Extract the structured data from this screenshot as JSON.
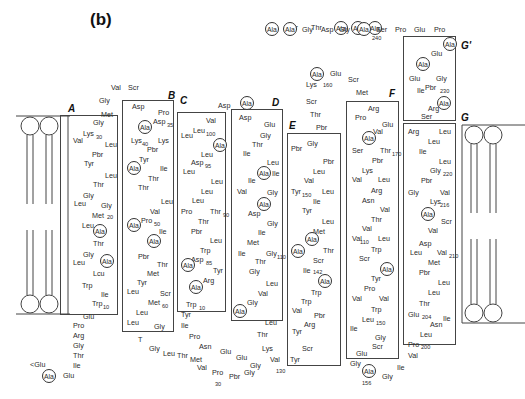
{
  "panel_label": "(b)",
  "colors": {
    "line": "#444444",
    "text": "#2a2a2a"
  },
  "helices": [
    {
      "label": "A",
      "box": [
        60,
        115,
        58,
        200
      ],
      "label_pos": [
        68,
        103
      ]
    },
    {
      "label": "B",
      "box": [
        122,
        100,
        52,
        232
      ],
      "label_pos": [
        168,
        90
      ]
    },
    {
      "label": "C",
      "box": [
        177,
        112,
        49,
        200
      ],
      "label_pos": [
        180,
        95
      ]
    },
    {
      "label": "D",
      "box": [
        231,
        109,
        52,
        212
      ],
      "label_pos": [
        272,
        97
      ]
    },
    {
      "label": "E",
      "box": [
        287,
        133,
        54,
        233
      ],
      "label_pos": [
        289,
        120
      ]
    },
    {
      "label": "F",
      "box": [
        346,
        101,
        53,
        258
      ],
      "label_pos": [
        389,
        88
      ]
    },
    {
      "label": "G'",
      "box": [
        403,
        36,
        53,
        85
      ],
      "label_pos": [
        461,
        40
      ]
    },
    {
      "label": "G",
      "box": [
        403,
        123,
        53,
        222
      ],
      "label_pos": [
        461,
        112
      ]
    }
  ],
  "membrane": [
    {
      "name": "left-bilayer",
      "x": 18,
      "y": 116,
      "w": 48,
      "h": 200
    },
    {
      "name": "right-bilayer",
      "x": 462,
      "y": 125,
      "w": 50,
      "h": 200
    }
  ],
  "residues": [
    {
      "t": "Scr",
      "x": 287,
      "y": 24
    },
    {
      "t": "Thr",
      "x": 311,
      "y": 24
    },
    {
      "t": "Ala",
      "x": 334,
      "y": 21,
      "c": true
    },
    {
      "t": "Ala",
      "x": 351,
      "y": 21,
      "c": true
    },
    {
      "t": "Ala",
      "x": 368,
      "y": 21,
      "c": true
    },
    {
      "t": "Ala",
      "x": 265,
      "y": 22,
      "c": true
    },
    {
      "t": "Ala",
      "x": 283,
      "y": 22,
      "c": true
    },
    {
      "t": "Gly",
      "x": 302,
      "y": 26
    },
    {
      "t": "Asp",
      "x": 321,
      "y": 26
    },
    {
      "t": "Gly",
      "x": 339,
      "y": 26
    },
    {
      "t": "Ala",
      "x": 357,
      "y": 22,
      "c": true
    },
    {
      "t": "Ser",
      "x": 376,
      "y": 26
    },
    {
      "t": "240",
      "x": 372,
      "y": 34,
      "s": true
    },
    {
      "t": "Pro",
      "x": 395,
      "y": 26
    },
    {
      "t": "Glu",
      "x": 414,
      "y": 26
    },
    {
      "t": "Pro",
      "x": 434,
      "y": 26
    },
    {
      "t": "Ala",
      "x": 443,
      "y": 37,
      "c": true
    },
    {
      "t": "Glu",
      "x": 431,
      "y": 50
    },
    {
      "t": "Ala",
      "x": 416,
      "y": 57,
      "c": true
    },
    {
      "t": "Glu",
      "x": 409,
      "y": 75
    },
    {
      "t": "Gly",
      "x": 436,
      "y": 75
    },
    {
      "t": "Ile",
      "x": 417,
      "y": 87
    },
    {
      "t": "Pbr",
      "x": 425,
      "y": 84
    },
    {
      "t": "230",
      "x": 440,
      "y": 87,
      "s": true
    },
    {
      "t": "Ala",
      "x": 437,
      "y": 96,
      "c": true
    },
    {
      "t": "Arg",
      "x": 428,
      "y": 105
    },
    {
      "t": "Ser",
      "x": 421,
      "y": 113
    },
    {
      "t": "Ala",
      "x": 310,
      "y": 67,
      "c": true
    },
    {
      "t": "Glu",
      "x": 330,
      "y": 70
    },
    {
      "t": "Scr",
      "x": 348,
      "y": 76
    },
    {
      "t": "Lys",
      "x": 306,
      "y": 81
    },
    {
      "t": "160",
      "x": 323,
      "y": 81,
      "s": true
    },
    {
      "t": "Met",
      "x": 356,
      "y": 89
    },
    {
      "t": "Scr",
      "x": 306,
      "y": 98
    },
    {
      "t": "Thr",
      "x": 310,
      "y": 111
    },
    {
      "t": "Pbr",
      "x": 316,
      "y": 124
    },
    {
      "t": "Val",
      "x": 111,
      "y": 84
    },
    {
      "t": "Scr",
      "x": 128,
      "y": 84
    },
    {
      "t": "Gly",
      "x": 99,
      "y": 97
    },
    {
      "t": "Met",
      "x": 101,
      "y": 111
    },
    {
      "t": "Gly",
      "x": 93,
      "y": 119
    },
    {
      "t": "Lys",
      "x": 83,
      "y": 130
    },
    {
      "t": "30",
      "x": 96,
      "y": 133,
      "s": true
    },
    {
      "t": "Val",
      "x": 73,
      "y": 137
    },
    {
      "t": "Leu",
      "x": 105,
      "y": 141
    },
    {
      "t": "Pbr",
      "x": 92,
      "y": 151
    },
    {
      "t": "Tyr",
      "x": 84,
      "y": 160
    },
    {
      "t": "Leu",
      "x": 105,
      "y": 172
    },
    {
      "t": "Thr",
      "x": 93,
      "y": 181
    },
    {
      "t": "Gly",
      "x": 83,
      "y": 192
    },
    {
      "t": "Leu",
      "x": 74,
      "y": 200
    },
    {
      "t": "Gly",
      "x": 101,
      "y": 202
    },
    {
      "t": "Met",
      "x": 92,
      "y": 212
    },
    {
      "t": "20",
      "x": 107,
      "y": 213,
      "s": true
    },
    {
      "t": "Leu",
      "x": 82,
      "y": 222
    },
    {
      "t": "Ala",
      "x": 93,
      "y": 224,
      "c": true
    },
    {
      "t": "Thr",
      "x": 93,
      "y": 240
    },
    {
      "t": "Gly",
      "x": 83,
      "y": 251
    },
    {
      "t": "Leu",
      "x": 73,
      "y": 259
    },
    {
      "t": "Ala",
      "x": 100,
      "y": 254,
      "c": true
    },
    {
      "t": "Lcu",
      "x": 93,
      "y": 270
    },
    {
      "t": "Trp",
      "x": 82,
      "y": 282
    },
    {
      "t": "Ile",
      "x": 101,
      "y": 291
    },
    {
      "t": "Trp",
      "x": 92,
      "y": 300
    },
    {
      "t": "10",
      "x": 103,
      "y": 303,
      "s": true
    },
    {
      "t": "Glu",
      "x": 83,
      "y": 313
    },
    {
      "t": "Pro",
      "x": 73,
      "y": 322
    },
    {
      "t": "Arg",
      "x": 73,
      "y": 332
    },
    {
      "t": "Gly",
      "x": 73,
      "y": 342
    },
    {
      "t": "Thr",
      "x": 73,
      "y": 352
    },
    {
      "t": "Ile",
      "x": 73,
      "y": 362
    },
    {
      "t": "<Glu",
      "x": 30,
      "y": 361
    },
    {
      "t": "Ala",
      "x": 42,
      "y": 369,
      "c": true
    },
    {
      "t": "Glu",
      "x": 63,
      "y": 372
    },
    {
      "t": "Asp",
      "x": 132,
      "y": 103
    },
    {
      "t": "Pro",
      "x": 158,
      "y": 109
    },
    {
      "t": "Ala",
      "x": 138,
      "y": 120,
      "c": true
    },
    {
      "t": "Asp",
      "x": 153,
      "y": 118
    },
    {
      "t": "35",
      "x": 167,
      "y": 121,
      "s": true
    },
    {
      "t": "Lys",
      "x": 131,
      "y": 137
    },
    {
      "t": "40",
      "x": 142,
      "y": 140,
      "s": true
    },
    {
      "t": "Lys",
      "x": 158,
      "y": 137
    },
    {
      "t": "Pbr",
      "x": 147,
      "y": 146
    },
    {
      "t": "Tyr",
      "x": 139,
      "y": 156
    },
    {
      "t": "Ala",
      "x": 127,
      "y": 161,
      "c": true
    },
    {
      "t": "Ile",
      "x": 160,
      "y": 165
    },
    {
      "t": "Thr",
      "x": 148,
      "y": 175
    },
    {
      "t": "Thr",
      "x": 138,
      "y": 184
    },
    {
      "t": "Leu",
      "x": 161,
      "y": 198
    },
    {
      "t": "Val",
      "x": 150,
      "y": 208
    },
    {
      "t": "Ala",
      "x": 127,
      "y": 218,
      "c": true
    },
    {
      "t": "Pro",
      "x": 141,
      "y": 217
    },
    {
      "t": "50",
      "x": 154,
      "y": 220,
      "s": true
    },
    {
      "t": "Ile",
      "x": 159,
      "y": 228
    },
    {
      "t": "Ala",
      "x": 147,
      "y": 234,
      "c": true
    },
    {
      "t": "Pbr",
      "x": 138,
      "y": 253
    },
    {
      "t": "Thr",
      "x": 157,
      "y": 261
    },
    {
      "t": "Met",
      "x": 147,
      "y": 270
    },
    {
      "t": "Tyr",
      "x": 137,
      "y": 279
    },
    {
      "t": "Leu",
      "x": 127,
      "y": 288
    },
    {
      "t": "Scr",
      "x": 160,
      "y": 290
    },
    {
      "t": "Met",
      "x": 148,
      "y": 299
    },
    {
      "t": "60",
      "x": 162,
      "y": 302,
      "s": true
    },
    {
      "t": "Leu",
      "x": 136,
      "y": 309
    },
    {
      "t": "Leu",
      "x": 127,
      "y": 319
    },
    {
      "t": "Gly",
      "x": 154,
      "y": 323
    },
    {
      "t": "T",
      "x": 138,
      "y": 336
    },
    {
      "t": "Gly",
      "x": 149,
      "y": 345
    },
    {
      "t": "Leu",
      "x": 163,
      "y": 350
    },
    {
      "t": "Thr",
      "x": 177,
      "y": 352
    },
    {
      "t": "Met",
      "x": 190,
      "y": 356
    },
    {
      "t": "Val",
      "x": 197,
      "y": 364
    },
    {
      "t": "Pro",
      "x": 212,
      "y": 369
    },
    {
      "t": "30",
      "x": 215,
      "y": 380,
      "s": true
    },
    {
      "t": "Pbr",
      "x": 229,
      "y": 373
    },
    {
      "t": "Gly",
      "x": 244,
      "y": 369
    },
    {
      "t": "Asp",
      "x": 218,
      "y": 102
    },
    {
      "t": "Ala",
      "x": 240,
      "y": 96,
      "c": true
    },
    {
      "t": "Val",
      "x": 206,
      "y": 117
    },
    {
      "t": "Leu",
      "x": 193,
      "y": 127
    },
    {
      "t": "100",
      "x": 206,
      "y": 130,
      "s": true
    },
    {
      "t": "Leu",
      "x": 181,
      "y": 132
    },
    {
      "t": "Ala",
      "x": 213,
      "y": 138,
      "c": true
    },
    {
      "t": "Leu",
      "x": 201,
      "y": 151
    },
    {
      "t": "Asp",
      "x": 191,
      "y": 159
    },
    {
      "t": "95",
      "x": 205,
      "y": 162,
      "s": true
    },
    {
      "t": "Leu",
      "x": 183,
      "y": 168
    },
    {
      "t": "Leu",
      "x": 211,
      "y": 178
    },
    {
      "t": "Leu",
      "x": 201,
      "y": 188
    },
    {
      "t": "Leu",
      "x": 192,
      "y": 197
    },
    {
      "t": "Pro",
      "x": 181,
      "y": 208
    },
    {
      "t": "Thr",
      "x": 210,
      "y": 208
    },
    {
      "t": "90",
      "x": 223,
      "y": 211,
      "s": true
    },
    {
      "t": "Thr",
      "x": 198,
      "y": 218
    },
    {
      "t": "Pbr",
      "x": 191,
      "y": 228
    },
    {
      "t": "Leu",
      "x": 210,
      "y": 237
    },
    {
      "t": "Trp",
      "x": 200,
      "y": 247
    },
    {
      "t": "Asp",
      "x": 191,
      "y": 256
    },
    {
      "t": "85",
      "x": 206,
      "y": 259,
      "s": true
    },
    {
      "t": "Ala",
      "x": 181,
      "y": 258,
      "c": true
    },
    {
      "t": "Tyr",
      "x": 213,
      "y": 267
    },
    {
      "t": "Arg",
      "x": 203,
      "y": 277
    },
    {
      "t": "Ala",
      "x": 189,
      "y": 280,
      "c": true
    },
    {
      "t": "Trp",
      "x": 186,
      "y": 301
    },
    {
      "t": "10",
      "x": 199,
      "y": 304,
      "s": true
    },
    {
      "t": "Tyr",
      "x": 181,
      "y": 311
    },
    {
      "t": "Ile",
      "x": 181,
      "y": 322
    },
    {
      "t": "Pro",
      "x": 189,
      "y": 333
    },
    {
      "t": "Asn",
      "x": 199,
      "y": 343
    },
    {
      "t": "Glu",
      "x": 220,
      "y": 348
    },
    {
      "t": "Glu",
      "x": 236,
      "y": 354
    },
    {
      "t": "Gly",
      "x": 250,
      "y": 362
    },
    {
      "t": "Asp",
      "x": 239,
      "y": 114
    },
    {
      "t": "Glu",
      "x": 264,
      "y": 121
    },
    {
      "t": "Gly",
      "x": 260,
      "y": 132
    },
    {
      "t": "Thr",
      "x": 252,
      "y": 141
    },
    {
      "t": "Ile",
      "x": 243,
      "y": 150
    },
    {
      "t": "Leu",
      "x": 267,
      "y": 159
    },
    {
      "t": "Ala",
      "x": 257,
      "y": 166,
      "c": true
    },
    {
      "t": "Ile",
      "x": 272,
      "y": 170
    },
    {
      "t": "Ile",
      "x": 248,
      "y": 177
    },
    {
      "t": "Val",
      "x": 237,
      "y": 188
    },
    {
      "t": "Gly",
      "x": 267,
      "y": 189
    },
    {
      "t": "Ala",
      "x": 257,
      "y": 197,
      "c": true
    },
    {
      "t": "Asp",
      "x": 248,
      "y": 210
    },
    {
      "t": "Gly",
      "x": 267,
      "y": 220
    },
    {
      "t": "Ile",
      "x": 258,
      "y": 229
    },
    {
      "t": "Met",
      "x": 247,
      "y": 239
    },
    {
      "t": "Ile",
      "x": 238,
      "y": 250
    },
    {
      "t": "Gly",
      "x": 266,
      "y": 250
    },
    {
      "t": "110",
      "x": 277,
      "y": 253,
      "s": true
    },
    {
      "t": "Thr",
      "x": 255,
      "y": 258
    },
    {
      "t": "Gly",
      "x": 249,
      "y": 268
    },
    {
      "t": "Leu",
      "x": 266,
      "y": 280
    },
    {
      "t": "Val",
      "x": 258,
      "y": 290
    },
    {
      "t": "Gly",
      "x": 247,
      "y": 299
    },
    {
      "t": "Ala",
      "x": 233,
      "y": 304,
      "c": true
    },
    {
      "t": "Leu",
      "x": 265,
      "y": 319
    },
    {
      "t": "Thr",
      "x": 257,
      "y": 331
    },
    {
      "t": "Lys",
      "x": 262,
      "y": 345
    },
    {
      "t": "Val",
      "x": 270,
      "y": 356
    },
    {
      "t": "130",
      "x": 276,
      "y": 367,
      "s": true
    },
    {
      "t": "Tyr",
      "x": 290,
      "y": 356
    },
    {
      "t": "Scr",
      "x": 302,
      "y": 345
    },
    {
      "t": "Pbr",
      "x": 291,
      "y": 145
    },
    {
      "t": "Gly",
      "x": 307,
      "y": 140
    },
    {
      "t": "Pbr",
      "x": 323,
      "y": 158
    },
    {
      "t": "Leu",
      "x": 313,
      "y": 168
    },
    {
      "t": "Val",
      "x": 304,
      "y": 177
    },
    {
      "t": "Tyr",
      "x": 291,
      "y": 188
    },
    {
      "t": "150",
      "x": 302,
      "y": 191,
      "s": true
    },
    {
      "t": "Leu",
      "x": 322,
      "y": 188
    },
    {
      "t": "Ile",
      "x": 313,
      "y": 198
    },
    {
      "t": "Tyr",
      "x": 302,
      "y": 207
    },
    {
      "t": "Leu",
      "x": 322,
      "y": 218
    },
    {
      "t": "Met",
      "x": 313,
      "y": 228
    },
    {
      "t": "Ala",
      "x": 305,
      "y": 232,
      "c": true
    },
    {
      "t": "Ala",
      "x": 291,
      "y": 244,
      "c": true
    },
    {
      "t": "Thr",
      "x": 323,
      "y": 247
    },
    {
      "t": "Scr",
      "x": 313,
      "y": 257
    },
    {
      "t": "Ile",
      "x": 303,
      "y": 267
    },
    {
      "t": "142",
      "x": 313,
      "y": 268,
      "s": true
    },
    {
      "t": "Ala",
      "x": 318,
      "y": 274,
      "c": true
    },
    {
      "t": "Trp",
      "x": 311,
      "y": 289
    },
    {
      "t": "Trp",
      "x": 301,
      "y": 298
    },
    {
      "t": "Val",
      "x": 292,
      "y": 307
    },
    {
      "t": "Pbr",
      "x": 314,
      "y": 312
    },
    {
      "t": "Arg",
      "x": 304,
      "y": 321
    },
    {
      "t": "Tyr",
      "x": 292,
      "y": 328
    },
    {
      "t": "Arg",
      "x": 368,
      "y": 105
    },
    {
      "t": "Pro",
      "x": 355,
      "y": 114
    },
    {
      "t": "Glu",
      "x": 382,
      "y": 121
    },
    {
      "t": "Val",
      "x": 373,
      "y": 128
    },
    {
      "t": "Ala",
      "x": 362,
      "y": 131,
      "c": true
    },
    {
      "t": "Ser",
      "x": 352,
      "y": 147
    },
    {
      "t": "Thr",
      "x": 380,
      "y": 147
    },
    {
      "t": "170",
      "x": 392,
      "y": 150,
      "s": true
    },
    {
      "t": "Pbr",
      "x": 372,
      "y": 157
    },
    {
      "t": "Lys",
      "x": 362,
      "y": 167
    },
    {
      "t": "Val",
      "x": 352,
      "y": 176
    },
    {
      "t": "Leu",
      "x": 378,
      "y": 176
    },
    {
      "t": "Arg",
      "x": 371,
      "y": 187
    },
    {
      "t": "Asn",
      "x": 362,
      "y": 197
    },
    {
      "t": "Val",
      "x": 380,
      "y": 206
    },
    {
      "t": "Thr",
      "x": 371,
      "y": 216
    },
    {
      "t": "Val",
      "x": 362,
      "y": 225
    },
    {
      "t": "Val",
      "x": 352,
      "y": 235
    },
    {
      "t": "110",
      "x": 360,
      "y": 238,
      "s": true
    },
    {
      "t": "Leu",
      "x": 378,
      "y": 235
    },
    {
      "t": "Trp",
      "x": 371,
      "y": 246
    },
    {
      "t": "Scr",
      "x": 359,
      "y": 255
    },
    {
      "t": "Ala",
      "x": 380,
      "y": 262,
      "c": true
    },
    {
      "t": "Tyr",
      "x": 371,
      "y": 275
    },
    {
      "t": "Pro",
      "x": 364,
      "y": 285
    },
    {
      "t": "Val",
      "x": 352,
      "y": 295
    },
    {
      "t": "Val",
      "x": 379,
      "y": 295
    },
    {
      "t": "Trp",
      "x": 371,
      "y": 306
    },
    {
      "t": "Leu",
      "x": 362,
      "y": 316
    },
    {
      "t": "150",
      "x": 376,
      "y": 319,
      "s": true
    },
    {
      "t": "Ile",
      "x": 350,
      "y": 325
    },
    {
      "t": "Gly",
      "x": 375,
      "y": 334
    },
    {
      "t": "Scr",
      "x": 372,
      "y": 343
    },
    {
      "t": "Glu",
      "x": 356,
      "y": 350
    },
    {
      "t": "Gly",
      "x": 350,
      "y": 360
    },
    {
      "t": "Ala",
      "x": 362,
      "y": 364,
      "c": true
    },
    {
      "t": "156",
      "x": 362,
      "y": 379,
      "s": true
    },
    {
      "t": "Gly",
      "x": 382,
      "y": 373
    },
    {
      "t": "Ile",
      "x": 397,
      "y": 364
    },
    {
      "t": "Val",
      "x": 408,
      "y": 352
    },
    {
      "t": "Arg",
      "x": 408,
      "y": 128
    },
    {
      "t": "Leu",
      "x": 439,
      "y": 128
    },
    {
      "t": "Leu",
      "x": 428,
      "y": 138
    },
    {
      "t": "Ile",
      "x": 419,
      "y": 148
    },
    {
      "t": "Leu",
      "x": 439,
      "y": 158
    },
    {
      "t": "Gly",
      "x": 430,
      "y": 167
    },
    {
      "t": "220",
      "x": 443,
      "y": 170,
      "s": true
    },
    {
      "t": "Pbr",
      "x": 421,
      "y": 177
    },
    {
      "t": "Gly",
      "x": 408,
      "y": 189
    },
    {
      "t": "Val",
      "x": 440,
      "y": 189
    },
    {
      "t": "Lys",
      "x": 430,
      "y": 198
    },
    {
      "t": "216",
      "x": 440,
      "y": 201,
      "s": true
    },
    {
      "t": "Ala",
      "x": 421,
      "y": 207,
      "c": true
    },
    {
      "t": "Scr",
      "x": 441,
      "y": 218
    },
    {
      "t": "Val",
      "x": 428,
      "y": 227
    },
    {
      "t": "Asp",
      "x": 419,
      "y": 240
    },
    {
      "t": "Leu",
      "x": 410,
      "y": 249
    },
    {
      "t": "Val",
      "x": 437,
      "y": 249
    },
    {
      "t": "210",
      "x": 449,
      "y": 252,
      "s": true
    },
    {
      "t": "Met",
      "x": 428,
      "y": 259
    },
    {
      "t": "Pbr",
      "x": 419,
      "y": 269
    },
    {
      "t": "Leu",
      "x": 438,
      "y": 279
    },
    {
      "t": "Leu",
      "x": 428,
      "y": 289
    },
    {
      "t": "Thr",
      "x": 419,
      "y": 300
    },
    {
      "t": "Glu",
      "x": 408,
      "y": 311
    },
    {
      "t": "204",
      "x": 422,
      "y": 313,
      "s": true
    },
    {
      "t": "Ile",
      "x": 443,
      "y": 315
    },
    {
      "t": "Asn",
      "x": 430,
      "y": 321
    },
    {
      "t": "Leu",
      "x": 420,
      "y": 331
    },
    {
      "t": "Pro",
      "x": 408,
      "y": 341
    },
    {
      "t": "200",
      "x": 421,
      "y": 343,
      "s": true
    }
  ]
}
